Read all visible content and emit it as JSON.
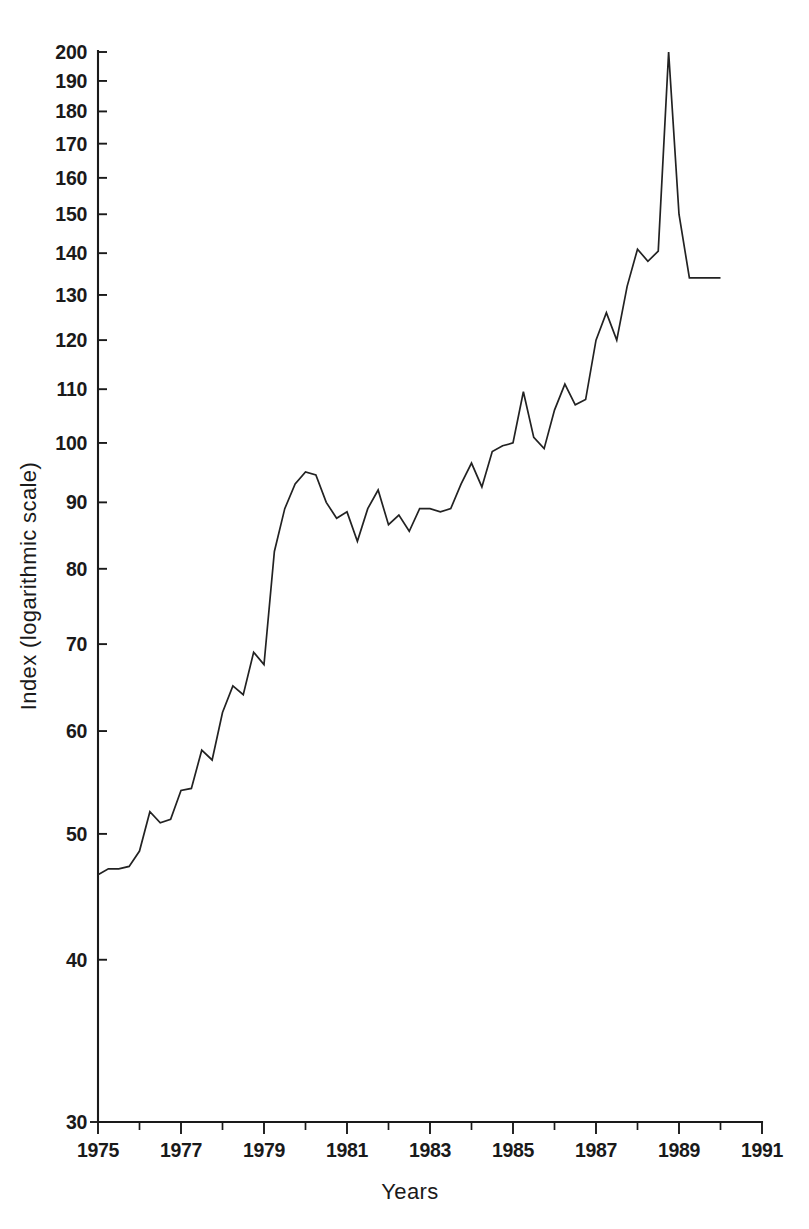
{
  "chart_data": {
    "type": "line",
    "title": "",
    "xlabel": "Years",
    "ylabel": "Index (logarithmic scale)",
    "yscale": "log",
    "ylim": [
      30,
      200
    ],
    "xlim": [
      1975,
      1991
    ],
    "grid": false,
    "legend": null,
    "y_tick_labels": [
      "200",
      "190",
      "180",
      "170",
      "160",
      "150",
      "140",
      "130",
      "120",
      "110",
      "100",
      "90",
      "80",
      "70",
      "60",
      "50",
      "40",
      "30"
    ],
    "y_tick_values": [
      200,
      190,
      180,
      170,
      160,
      150,
      140,
      130,
      120,
      110,
      100,
      90,
      80,
      70,
      60,
      50,
      40,
      30
    ],
    "x_tick_labels": [
      "1975",
      "1977",
      "1979",
      "1981",
      "1983",
      "1985",
      "1987",
      "1989",
      "1991"
    ],
    "x_tick_values": [
      1975,
      1977,
      1979,
      1981,
      1983,
      1985,
      1987,
      1989,
      1991
    ],
    "x_minor_tick_values": [
      1976,
      1978,
      1980,
      1982,
      1984,
      1986,
      1988,
      1990
    ],
    "series": [
      {
        "name": "Index",
        "x": [
          1975.0,
          1975.25,
          1975.5,
          1975.75,
          1976.0,
          1976.25,
          1976.5,
          1976.75,
          1977.0,
          1977.25,
          1977.5,
          1977.75,
          1978.0,
          1978.25,
          1978.5,
          1978.75,
          1979.0,
          1979.25,
          1979.5,
          1979.75,
          1980.0,
          1980.25,
          1980.5,
          1980.75,
          1981.0,
          1981.25,
          1981.5,
          1981.75,
          1982.0,
          1982.25,
          1982.5,
          1982.75,
          1983.0,
          1983.25,
          1983.5,
          1983.75,
          1984.0,
          1984.25,
          1984.5,
          1984.75,
          1985.0,
          1985.25,
          1985.5,
          1985.75,
          1986.0,
          1986.25,
          1986.5,
          1986.75,
          1987.0,
          1987.25,
          1987.5,
          1987.75,
          1988.0,
          1988.25,
          1988.5,
          1988.75,
          1989.0,
          1989.25,
          1989.5,
          1989.75,
          1990.0,
          1990.25,
          1990.5
        ],
        "y": [
          46.5,
          47.0,
          47.0,
          47.2,
          48.5,
          52.0,
          51.0,
          51.3,
          54.0,
          54.2,
          58.0,
          57.0,
          62.0,
          65.0,
          64.0,
          69.0,
          67.5,
          82.5,
          89.0,
          93.0,
          95.0,
          94.5,
          90.0,
          87.5,
          88.5,
          84.0,
          89.0,
          92.0,
          86.5,
          88.0,
          85.5,
          89.0,
          89.0,
          88.5,
          89.0,
          93.0,
          96.5,
          92.5,
          98.5,
          99.5,
          100.0,
          109.5,
          101.0,
          99.0,
          106.0,
          111.0,
          107.0,
          108.0,
          120.0,
          126.0,
          120.0,
          132.0,
          141.0,
          138.0,
          140.5,
          200.0,
          150.0,
          134.0,
          134.0,
          134.0,
          134.0,
          134.0,
          134.0
        ]
      }
    ]
  }
}
